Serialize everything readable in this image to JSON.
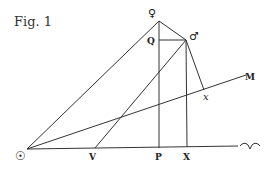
{
  "figure": {
    "caption": "Fig. 1",
    "labels": {
      "sun": "☉",
      "venus": "♀",
      "mars": "♂",
      "Q": "Q",
      "M": "M",
      "x": "x",
      "V": "V",
      "P": "P",
      "X": "X",
      "aries": "♈"
    },
    "points": {
      "sun": [
        27,
        149
      ],
      "venus": [
        159,
        21
      ],
      "mars": [
        186,
        40
      ],
      "Q": [
        159,
        40
      ],
      "P": [
        159,
        148
      ],
      "X": [
        187,
        147
      ],
      "V": [
        95,
        148
      ],
      "x": [
        204,
        90
      ],
      "M": [
        246,
        75
      ],
      "baseline_end": [
        238,
        146
      ]
    }
  }
}
